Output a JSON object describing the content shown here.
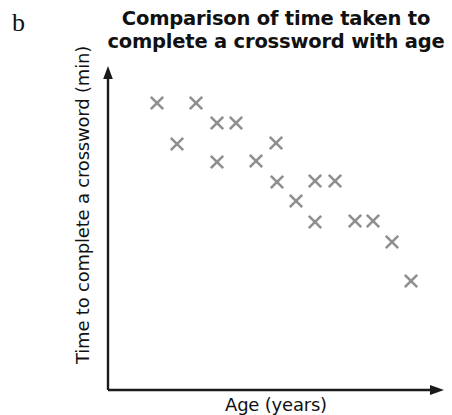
{
  "panel": {
    "label": "b"
  },
  "chart_data": {
    "type": "scatter",
    "title": "Comparison of time taken to complete a crossword with age",
    "title_line1": "Comparison of time taken to",
    "title_line2": "complete a crossword with age",
    "xlabel": "Age (years)",
    "ylabel": "Time to complete a crossword (min)",
    "marker_style": "x",
    "marker_color": "#8f8f8f",
    "axis_color": "#1a1a1a",
    "grid": false,
    "legend": null,
    "xticks": [],
    "yticks": [],
    "xlim": [
      0,
      100
    ],
    "ylim": [
      0,
      100
    ],
    "n_points": 18,
    "trend": "negative",
    "points": [
      {
        "x": 14.6,
        "y": 92.7
      },
      {
        "x": 26.2,
        "y": 92.7
      },
      {
        "x": 32.4,
        "y": 86.2
      },
      {
        "x": 38.1,
        "y": 86.2
      },
      {
        "x": 20.5,
        "y": 79.4
      },
      {
        "x": 50.0,
        "y": 79.7
      },
      {
        "x": 32.4,
        "y": 73.5
      },
      {
        "x": 44.1,
        "y": 73.9
      },
      {
        "x": 50.3,
        "y": 67.1
      },
      {
        "x": 61.5,
        "y": 67.4
      },
      {
        "x": 67.4,
        "y": 67.4
      },
      {
        "x": 55.6,
        "y": 60.6
      },
      {
        "x": 61.5,
        "y": 54.2
      },
      {
        "x": 73.2,
        "y": 54.5
      },
      {
        "x": 78.5,
        "y": 54.5
      },
      {
        "x": 84.1,
        "y": 47.7
      },
      {
        "x": 89.7,
        "y": 34.5
      }
    ],
    "points_px": [
      {
        "px": 157,
        "py": 103
      },
      {
        "px": 196,
        "py": 103
      },
      {
        "px": 217,
        "py": 123
      },
      {
        "px": 236,
        "py": 123
      },
      {
        "px": 177,
        "py": 144
      },
      {
        "px": 276,
        "py": 143
      },
      {
        "px": 217,
        "py": 162
      },
      {
        "px": 256,
        "py": 161
      },
      {
        "px": 277,
        "py": 182
      },
      {
        "px": 315,
        "py": 181
      },
      {
        "px": 335,
        "py": 181
      },
      {
        "px": 296,
        "py": 201
      },
      {
        "px": 315,
        "py": 222
      },
      {
        "px": 355,
        "py": 221
      },
      {
        "px": 373,
        "py": 221
      },
      {
        "px": 392,
        "py": 242
      },
      {
        "px": 411,
        "py": 281
      }
    ]
  }
}
